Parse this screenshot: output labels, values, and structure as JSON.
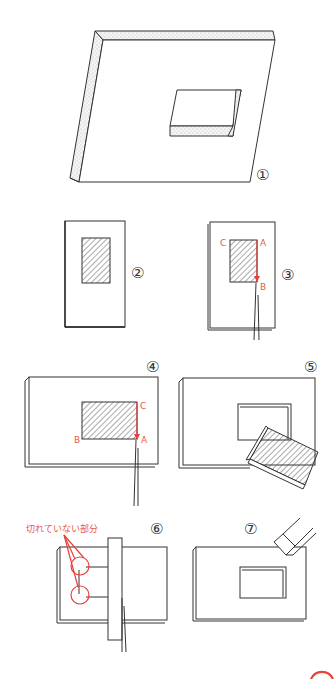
{
  "figure": {
    "steps": [
      {
        "id": 1,
        "marker": "①"
      },
      {
        "id": 2,
        "marker": "②"
      },
      {
        "id": 3,
        "marker": "③",
        "points": {
          "a": "A",
          "b": "B",
          "c": "C"
        }
      },
      {
        "id": 4,
        "marker": "④",
        "points": {
          "a": "A",
          "b": "B",
          "c": "C"
        }
      },
      {
        "id": 5,
        "marker": "⑤"
      },
      {
        "id": 6,
        "marker": "⑥",
        "note": "切れていない部分"
      },
      {
        "id": 7,
        "marker": "⑦"
      }
    ]
  },
  "colors": {
    "line": "#333333",
    "accent_red": "#e8403a",
    "background": "#ffffff"
  }
}
